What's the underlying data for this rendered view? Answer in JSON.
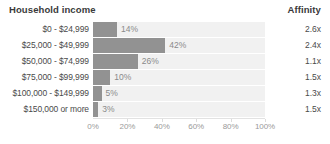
{
  "header": {
    "title": "Household income",
    "affinity_label": "Affinity"
  },
  "chart_data": {
    "type": "bar",
    "title": "Household income",
    "orientation": "horizontal",
    "xlabel": "",
    "ylabel": "Household income",
    "xlim": [
      0,
      100
    ],
    "grid": false,
    "legend": "none",
    "categories": [
      "$0 - $24,999",
      "$25,000 - $49,999",
      "$50,000 - $74,999",
      "$75,000 - $99,999",
      "$100,000 - $149,999",
      "$150,000 or more"
    ],
    "values": [
      14,
      42,
      26,
      10,
      5,
      3
    ],
    "value_labels": [
      "14%",
      "42%",
      "26%",
      "10%",
      "5%",
      "3%"
    ],
    "tick_labels": [
      "0%",
      "20%",
      "40%",
      "60%",
      "80%",
      "100%"
    ],
    "tick_values": [
      0,
      20,
      40,
      60,
      80,
      100
    ],
    "affinity_labels": [
      "2.6x",
      "2.4x",
      "1.1x",
      "1.5x",
      "1.3x",
      "1.5x"
    ],
    "affinity_values": [
      2.6,
      2.4,
      1.1,
      1.5,
      1.3,
      1.5
    ],
    "colors": {
      "bar": "#929292",
      "track": "#f1f1f1",
      "text": "#4a4a4a",
      "value_text": "#8a8a8a",
      "axis": "#e2e2e2"
    }
  },
  "rows": [
    {
      "label": "$0 - $24,999",
      "value": 14,
      "value_label": "14%",
      "affinity": "2.6x"
    },
    {
      "label": "$25,000 - $49,999",
      "value": 42,
      "value_label": "42%",
      "affinity": "2.4x"
    },
    {
      "label": "$50,000 - $74,999",
      "value": 26,
      "value_label": "26%",
      "affinity": "1.1x"
    },
    {
      "label": "$75,000 - $99,999",
      "value": 10,
      "value_label": "10%",
      "affinity": "1.5x"
    },
    {
      "label": "$100,000 - $149,999",
      "value": 5,
      "value_label": "5%",
      "affinity": "1.3x"
    },
    {
      "label": "$150,000 or more",
      "value": 3,
      "value_label": "3%",
      "affinity": "1.5x"
    }
  ],
  "axis": {
    "ticks": [
      "0%",
      "20%",
      "40%",
      "60%",
      "80%",
      "100%"
    ]
  }
}
